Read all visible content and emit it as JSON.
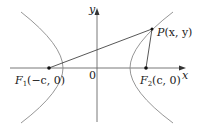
{
  "diagram": {
    "type": "hyperbola-foci",
    "axes": {
      "x_label": "x",
      "y_label": "y",
      "origin_label": "0"
    },
    "points": {
      "F1": {
        "name": "F",
        "subscript": "1",
        "coords": "(−c, 0)"
      },
      "F2": {
        "name": "F",
        "subscript": "2",
        "coords": "(c, 0)"
      },
      "P": {
        "name": "P",
        "coords": "(x, y)"
      }
    },
    "colors": {
      "curve": "#8a8a8a",
      "axis": "#6a6a6a",
      "segment": "#444444",
      "text": "#1a1a1a"
    }
  }
}
